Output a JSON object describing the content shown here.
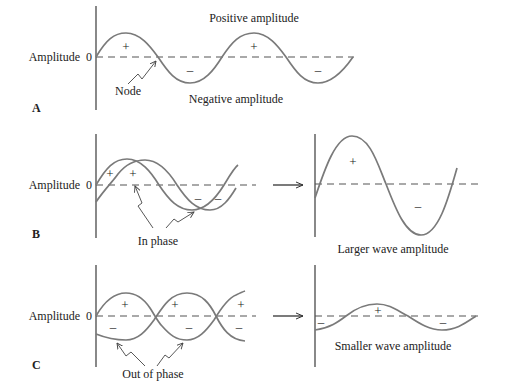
{
  "figure": {
    "panel_a": {
      "letter": "A",
      "y_label": "Amplitude",
      "zero_label": "0",
      "top_label": "Positive amplitude",
      "bottom_label": "Negative amplitude",
      "node_label": "Node",
      "signs": [
        "+",
        "–",
        "+",
        "–"
      ]
    },
    "panel_b": {
      "letter": "B",
      "y_label": "Amplitude",
      "zero_label": "0",
      "pointer_label": "In phase",
      "signs": [
        "+",
        "+",
        "–",
        "–"
      ],
      "result_label": "Larger wave amplitude",
      "result_signs": [
        "+",
        "–"
      ]
    },
    "panel_c": {
      "letter": "C",
      "y_label": "Amplitude",
      "zero_label": "0",
      "pointer_label": "Out of phase",
      "signs": [
        "+",
        "+",
        "+",
        "–",
        "–",
        "–"
      ],
      "result_label": "Smaller wave amplitude",
      "result_signs": [
        "–",
        "+",
        "–"
      ]
    }
  }
}
